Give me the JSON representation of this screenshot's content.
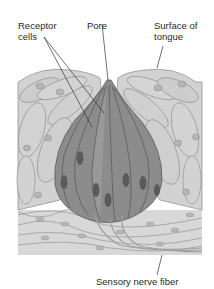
{
  "diagram": {
    "labels": {
      "receptor_cells": "Receptor\ncells",
      "pore": "Pore",
      "surface_of_tongue": "Surface of\ntongue",
      "sensory_nerve_fiber": "Sensory nerve fiber"
    },
    "colors": {
      "epithelium": "#cfcfcf",
      "epithelium_outline": "#8a8a8a",
      "receptor_dark": "#7a7a7a",
      "receptor_mid": "#909090",
      "nucleus": "#5a5a5a",
      "nerve": "#9a9a9a",
      "background": "#ffffff"
    }
  }
}
